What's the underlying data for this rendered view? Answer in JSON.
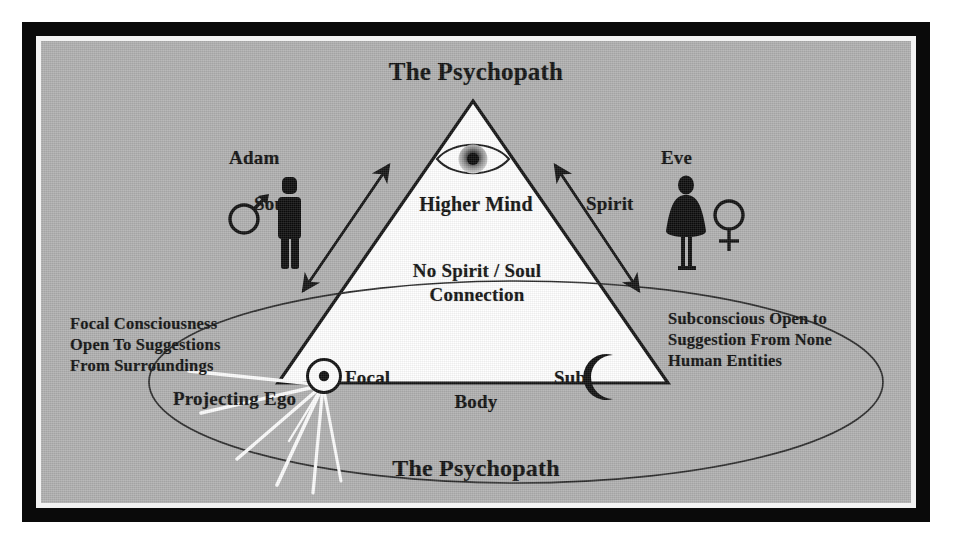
{
  "diagram": {
    "title_top": "The Psychopath",
    "title_bottom": "The Psychopath",
    "triangle": {
      "apex_label": "Higher Mind",
      "middle_label": "No Spirit / Soul Connection",
      "middle_label_line1": "No Spirit / Soul",
      "middle_label_line2": "Connection",
      "left_node_label": "Focal",
      "right_node_label": "Sub",
      "base_label": "Body"
    },
    "left_figure": {
      "name": "Adam",
      "gender_symbol": "♂",
      "arrow_label": "Soul"
    },
    "right_figure": {
      "name": "Eve",
      "gender_symbol": "♀",
      "arrow_label": "Spirit"
    },
    "left_text": {
      "line1": "Focal Consciousness",
      "line2": "Open To Suggestions",
      "line3": "From Surroundings"
    },
    "right_text": {
      "line1": "Subconscious Open to",
      "line2": "Suggestion From None",
      "line3": "Human Entities"
    },
    "ego_label": "Projecting Ego",
    "icons": {
      "eye": "all-seeing-eye-icon",
      "focal": "sun-circled-dot-icon",
      "sub": "crescent-moon-icon",
      "adam": "male-figure-icon",
      "eve": "female-figure-icon"
    },
    "colors": {
      "background_gray": "#b0b0b0",
      "frame_black": "#0a0a0a",
      "frame_white": "#f2f2f2",
      "triangle_fill": "#ffffff",
      "ink": "#111111",
      "ray_white": "#fdfdfd"
    }
  }
}
